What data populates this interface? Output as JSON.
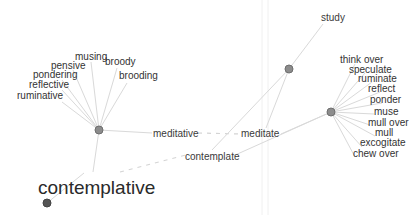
{
  "graph": {
    "colors": {
      "background": "#ffffff",
      "edge": "#d9d9d9",
      "node": "#8c8c8c",
      "node_dark": "#555555",
      "label": "#333333"
    },
    "focus_word": "contemplative",
    "hubs": {
      "meditative": "meditative",
      "meditate": "meditate",
      "contemplate": "contemplate",
      "study": "study"
    },
    "left_cluster": [
      "musing",
      "broody",
      "pensive",
      "brooding",
      "pondering",
      "reflective",
      "ruminative"
    ],
    "right_cluster": [
      "think over",
      "speculate",
      "ruminate",
      "reflect",
      "ponder",
      "muse",
      "mull over",
      "mull",
      "excogitate",
      "chew over"
    ]
  }
}
